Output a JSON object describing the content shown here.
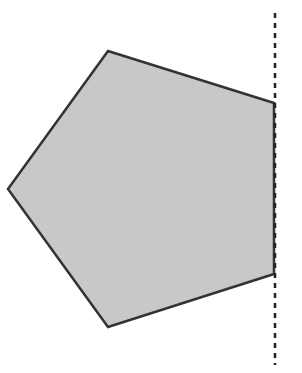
{
  "diagram": {
    "type": "geometry",
    "shapes": [
      {
        "kind": "pentagon",
        "points": "108,51 274,103 274,274 108,327 8,189",
        "fill": "#c8c8c8",
        "stroke": "#333333",
        "stroke_width": 2.5
      }
    ],
    "lines": [
      {
        "kind": "dashed-vertical-line",
        "x1": 275,
        "y1": 13,
        "x2": 275,
        "y2": 365,
        "stroke": "#222222",
        "stroke_width": 2.5,
        "dash": "5,5"
      }
    ],
    "colors": {
      "background": "#ffffff",
      "fill": "#c8c8c8",
      "stroke": "#333333"
    }
  }
}
